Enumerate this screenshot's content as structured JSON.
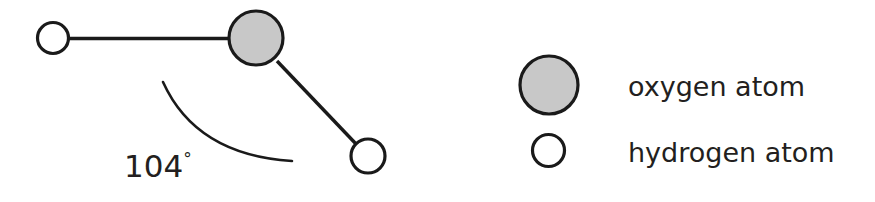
{
  "figure": {
    "background_color": "#ffffff",
    "width": 875,
    "height": 202
  },
  "molecule": {
    "name": "water-molecule",
    "angle_label": "104",
    "angle_degree_symbol": "°",
    "angle_full": "104°",
    "atoms": [
      {
        "id": "hydrogen-left",
        "element": "hydrogen",
        "label": "hydrogen atom",
        "cx": 53,
        "cy": 38,
        "r": 15.5,
        "fill": "#ffffff"
      },
      {
        "id": "oxygen-center",
        "element": "oxygen",
        "label": "oxygen atom",
        "cx": 256,
        "cy": 38,
        "r": 27,
        "fill": "#c8c8c8"
      },
      {
        "id": "hydrogen-lower-right",
        "element": "hydrogen",
        "label": "hydrogen atom",
        "cx": 368,
        "cy": 156,
        "r": 17,
        "fill": "#ffffff"
      }
    ],
    "bonds": [
      {
        "id": "bond-oxygen-hydrogen-left",
        "x1": 68,
        "y1": 38.5,
        "x2": 231,
        "y2": 38.5
      },
      {
        "id": "bond-oxygen-hydrogen-lower-right",
        "x1": 277,
        "y1": 61,
        "x2": 357,
        "y2": 145
      }
    ],
    "arc": {
      "id": "bond-angle-arc",
      "path": "M 163 82 Q 196 155 292 161"
    }
  },
  "legend": {
    "name": "atom-legend",
    "items": [
      {
        "key": "oxygen",
        "label": "oxygen atom",
        "swatch_fill": "#c8c8c8",
        "cx": 549,
        "cy": 85,
        "r": 29,
        "text_x": 628,
        "text_y": 96
      },
      {
        "key": "hydrogen",
        "label": "hydrogen atom",
        "swatch_fill": "#ffffff",
        "cx": 548.5,
        "cy": 150.5,
        "r": 16,
        "text_x": 628,
        "text_y": 162
      }
    ]
  },
  "colors": {
    "outline": "#1a1a1a",
    "text": "#231f20",
    "oxygen_fill": "#c8c8c8",
    "hydrogen_fill": "#ffffff",
    "background": "#ffffff"
  }
}
